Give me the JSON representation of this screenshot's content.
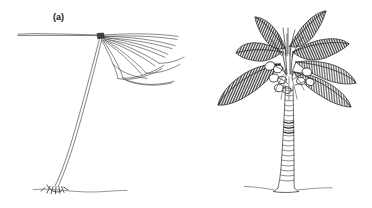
{
  "figure": {
    "width": 372,
    "height": 208,
    "background_color": "#ffffff",
    "ink_color": "#3a3a3a",
    "dark_ink_color": "#2b2b2b",
    "light_ink_color": "#7d7d7d",
    "style": "pen-and-ink line drawing"
  },
  "panels": [
    {
      "id": "a",
      "label": "(a)",
      "subject": "coconut palm with sparse declining crown and leaning slender trunk",
      "crown": {
        "frond_count": 11,
        "frond_style": "thin unshaded outline, drooping",
        "direction": "fronds radiate to the right and one long frond extends left"
      },
      "trunk": {
        "orientation": "leaning",
        "texture": "smooth thin double line"
      },
      "base": {
        "feature": "exposed root cluster at ground line"
      },
      "fruit_count": 0
    },
    {
      "id": "b",
      "label": "(b)",
      "subject": "healthy coconut palm with full crown and fruit bunches",
      "crown": {
        "frond_count": 8,
        "frond_style": "broad with dense vertical hatching",
        "direction": "fronds radiate outward and arch downward"
      },
      "trunk": {
        "orientation": "upright",
        "texture": "segmented horizontal leaf-scar rings"
      },
      "base": {
        "feature": "flared base on ground line"
      },
      "fruit_count": 9
    }
  ]
}
